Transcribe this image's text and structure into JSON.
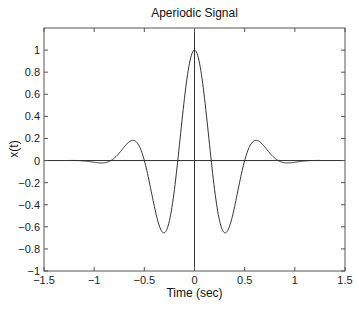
{
  "chart_data": {
    "type": "line",
    "title": "Aperiodic Signal",
    "xlabel": "Time (sec)",
    "ylabel": "x(t)",
    "xlim": [
      -1.5,
      1.5
    ],
    "ylim": [
      -1,
      1.2
    ],
    "xticks": [
      -1.5,
      -1,
      -0.5,
      0,
      0.5,
      1,
      1.5
    ],
    "xtick_labels": [
      "−1.5",
      "−1",
      "−0.5",
      "0",
      "0.5",
      "1",
      "1.5"
    ],
    "yticks": [
      -1,
      -0.8,
      -0.6,
      -0.4,
      -0.2,
      0,
      0.2,
      0.4,
      0.6,
      0.8,
      1
    ],
    "ytick_labels": [
      "−1",
      "−0.8",
      "−0.6",
      "−0.4",
      "−0.2",
      "0",
      "0.2",
      "0.4",
      "0.6",
      "0.8",
      "1"
    ],
    "grid": false,
    "reference_lines": {
      "horizontal_y": 0,
      "vertical_x": 0
    },
    "series": [
      {
        "name": "x(t)",
        "color": "#333333",
        "x": [
          -1.25,
          -1.2,
          -1.1,
          -1.0,
          -0.9,
          -0.8,
          -0.75,
          -0.7,
          -0.667,
          -0.6,
          -0.55,
          -0.5,
          -0.45,
          -0.4,
          -0.333,
          -0.3,
          -0.25,
          -0.2,
          -0.167,
          -0.1,
          -0.05,
          0,
          0.05,
          0.1,
          0.167,
          0.2,
          0.25,
          0.3,
          0.333,
          0.4,
          0.45,
          0.5,
          0.55,
          0.6,
          0.667,
          0.7,
          0.75,
          0.8,
          0.9,
          1.0,
          1.1,
          1.2,
          1.25
        ],
        "y": [
          0.001,
          0.003,
          -0.003,
          -0.016,
          -0.019,
          0.021,
          0.068,
          0.114,
          0.157,
          0.18,
          0.099,
          -0.0,
          -0.191,
          -0.381,
          -0.63,
          -0.576,
          -0.544,
          -0.498,
          -0.0,
          0.557,
          0.888,
          1.0,
          0.888,
          0.557,
          -0.0,
          -0.498,
          -0.544,
          -0.576,
          -0.63,
          -0.381,
          -0.191,
          -0.0,
          0.099,
          0.18,
          0.157,
          0.114,
          0.068,
          0.021,
          -0.019,
          -0.016,
          -0.003,
          0.003,
          0.001
        ]
      }
    ],
    "legend": null
  }
}
